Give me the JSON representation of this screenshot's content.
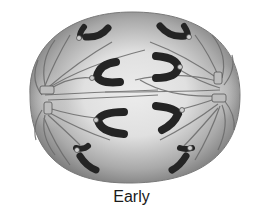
{
  "figure": {
    "caption": "Early",
    "colors": {
      "background": "#ffffff",
      "cell_outer": "#8a8a8a",
      "cell_inner": "#e6e6e6",
      "chromosome": "#2b2b2b",
      "spindle_fiber": "#6e6e6e",
      "centrosome": "#bdbdbd"
    }
  }
}
